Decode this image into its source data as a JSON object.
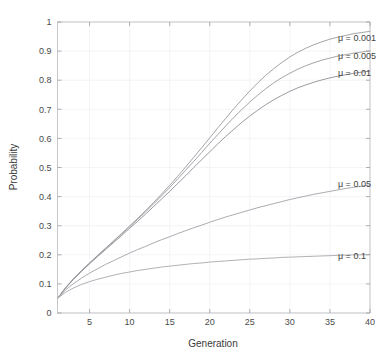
{
  "chart_data": {
    "type": "line",
    "title": "",
    "xlabel": "Generation",
    "ylabel": "Probability",
    "xlim": [
      1,
      40
    ],
    "ylim": [
      0,
      1
    ],
    "grid": true,
    "legend_position": "inline-right-of-curve-ends",
    "xticks": [
      5,
      10,
      15,
      20,
      25,
      30,
      35,
      40
    ],
    "xtick_labels": [
      "5",
      "10",
      "15",
      "20",
      "25",
      "30",
      "35",
      "40"
    ],
    "yticks": [
      0,
      0.1,
      0.2,
      0.3,
      0.4,
      0.5,
      0.6,
      0.7,
      0.8,
      0.9,
      1
    ],
    "ytick_labels": [
      "0",
      "0.1",
      "0.2",
      "0.3",
      "0.4",
      "0.5",
      "0.6",
      "0.7",
      "0.8",
      "0.9",
      "1"
    ],
    "x": [
      1,
      2,
      3,
      4,
      5,
      6,
      7,
      8,
      9,
      10,
      11,
      12,
      13,
      14,
      15,
      16,
      17,
      18,
      19,
      20,
      21,
      22,
      23,
      24,
      25,
      26,
      27,
      28,
      29,
      30,
      31,
      32,
      33,
      34,
      35,
      36,
      37,
      38,
      39,
      40
    ],
    "series": [
      {
        "name": "mu = 0.001",
        "label": "μ = 0.001",
        "color": "#9a9a9f",
        "label_x": 36.0,
        "label_y": 0.945,
        "values": [
          0.05,
          0.087,
          0.118,
          0.146,
          0.172,
          0.198,
          0.223,
          0.248,
          0.273,
          0.299,
          0.325,
          0.352,
          0.38,
          0.409,
          0.439,
          0.47,
          0.502,
          0.535,
          0.568,
          0.602,
          0.636,
          0.669,
          0.702,
          0.733,
          0.763,
          0.791,
          0.817,
          0.84,
          0.861,
          0.88,
          0.896,
          0.91,
          0.922,
          0.932,
          0.941,
          0.948,
          0.954,
          0.96,
          0.964,
          0.968
        ]
      },
      {
        "name": "mu = 0.005",
        "label": "μ = 0.005",
        "color": "#9a9a9f",
        "label_x": 36.0,
        "label_y": 0.885,
        "values": [
          0.05,
          0.086,
          0.117,
          0.145,
          0.171,
          0.196,
          0.221,
          0.246,
          0.271,
          0.296,
          0.322,
          0.348,
          0.375,
          0.403,
          0.431,
          0.461,
          0.491,
          0.521,
          0.552,
          0.583,
          0.613,
          0.643,
          0.672,
          0.699,
          0.725,
          0.749,
          0.771,
          0.791,
          0.809,
          0.824,
          0.838,
          0.85,
          0.86,
          0.869,
          0.876,
          0.883,
          0.888,
          0.893,
          0.897,
          0.901
        ]
      },
      {
        "name": "mu = 0.01",
        "label": "μ = 0.01",
        "color": "#8f8f95",
        "label_x": 36.0,
        "label_y": 0.825,
        "values": [
          0.05,
          0.085,
          0.116,
          0.143,
          0.169,
          0.194,
          0.218,
          0.242,
          0.266,
          0.291,
          0.315,
          0.34,
          0.366,
          0.392,
          0.418,
          0.445,
          0.472,
          0.5,
          0.527,
          0.554,
          0.581,
          0.607,
          0.631,
          0.655,
          0.677,
          0.697,
          0.716,
          0.733,
          0.748,
          0.762,
          0.774,
          0.784,
          0.793,
          0.801,
          0.808,
          0.814,
          0.819,
          0.824,
          0.828,
          0.831
        ]
      },
      {
        "name": "mu = 0.05",
        "label": "μ = 0.05",
        "color": "#a2a2a8",
        "label_x": 36.0,
        "label_y": 0.445,
        "values": [
          0.05,
          0.079,
          0.101,
          0.12,
          0.137,
          0.152,
          0.167,
          0.18,
          0.193,
          0.206,
          0.218,
          0.229,
          0.241,
          0.252,
          0.262,
          0.273,
          0.283,
          0.293,
          0.302,
          0.312,
          0.321,
          0.33,
          0.338,
          0.346,
          0.354,
          0.362,
          0.369,
          0.376,
          0.383,
          0.39,
          0.396,
          0.402,
          0.408,
          0.413,
          0.418,
          0.423,
          0.428,
          0.432,
          0.436,
          0.44
        ]
      },
      {
        "name": "mu = 0.1",
        "label": "μ = 0.1",
        "color": "#a8a8ae",
        "label_x": 36.0,
        "label_y": 0.195,
        "values": [
          0.05,
          0.071,
          0.086,
          0.098,
          0.108,
          0.116,
          0.123,
          0.13,
          0.136,
          0.141,
          0.146,
          0.15,
          0.154,
          0.158,
          0.161,
          0.164,
          0.167,
          0.17,
          0.172,
          0.175,
          0.177,
          0.179,
          0.181,
          0.183,
          0.185,
          0.186,
          0.188,
          0.189,
          0.191,
          0.192,
          0.193,
          0.194,
          0.195,
          0.196,
          0.197,
          0.198,
          0.199,
          0.2,
          0.2,
          0.201
        ]
      }
    ]
  },
  "colors": {
    "background": "#ffffff",
    "axis": "#b9b9bd",
    "grid": "#ededf2",
    "text": "#3f3f3f"
  }
}
